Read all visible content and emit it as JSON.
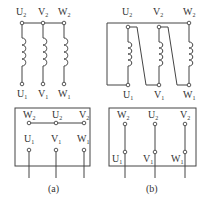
{
  "diagram": {
    "panel_a": {
      "caption": "(a)",
      "connection": "star",
      "schematic": {
        "top_labels": [
          {
            "base": "U",
            "sub": "2"
          },
          {
            "base": "V",
            "sub": "2"
          },
          {
            "base": "W",
            "sub": "2"
          }
        ],
        "bottom_labels": [
          {
            "base": "U",
            "sub": "1"
          },
          {
            "base": "V",
            "sub": "1"
          },
          {
            "base": "W",
            "sub": "1"
          }
        ]
      },
      "terminal_box": {
        "top_row": [
          {
            "base": "W",
            "sub": "2"
          },
          {
            "base": "U",
            "sub": "2"
          },
          {
            "base": "V",
            "sub": "2"
          }
        ],
        "bottom_row": [
          {
            "base": "U",
            "sub": "1"
          },
          {
            "base": "V",
            "sub": "1"
          },
          {
            "base": "W",
            "sub": "1"
          }
        ]
      }
    },
    "panel_b": {
      "caption": "(b)",
      "connection": "delta",
      "schematic": {
        "top_labels": [
          {
            "base": "U",
            "sub": "2"
          },
          {
            "base": "V",
            "sub": "2"
          },
          {
            "base": "W",
            "sub": "2"
          }
        ],
        "bottom_labels": [
          {
            "base": "U",
            "sub": "1"
          },
          {
            "base": "V",
            "sub": "1"
          },
          {
            "base": "W",
            "sub": "1"
          }
        ]
      },
      "terminal_box": {
        "top_row": [
          {
            "base": "W",
            "sub": "2"
          },
          {
            "base": "U",
            "sub": "2"
          },
          {
            "base": "V",
            "sub": "2"
          }
        ],
        "bottom_row": [
          {
            "base": "U",
            "sub": "1"
          },
          {
            "base": "V",
            "sub": "1"
          },
          {
            "base": "W",
            "sub": "1"
          }
        ]
      }
    },
    "colors": {
      "line": "#444444",
      "text": "#333333",
      "background": "#ffffff"
    }
  }
}
